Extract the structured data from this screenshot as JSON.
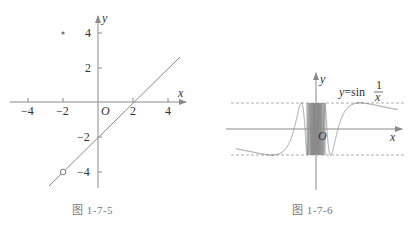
{
  "figure_1": {
    "caption": "图 1-7-5",
    "axis_x_label": "x",
    "axis_y_label": "y",
    "origin_label": "O",
    "x_ticks": [
      "−4",
      "−2",
      "2",
      "4"
    ],
    "y_ticks": [
      "4",
      "2",
      "−2",
      "−4"
    ],
    "line": "y = x − 2 (x ≠ −2)",
    "filled_point": "(−2, 4)",
    "open_point": "(−2, −4)"
  },
  "figure_2": {
    "caption": "图 1-7-6",
    "axis_x_label": "x",
    "axis_y_label": "y",
    "origin_label": "O",
    "function_label_prefix": "y=sin",
    "function_label_num": "1",
    "function_label_den": "x",
    "bounds": [
      "y = 1",
      "y = −1"
    ]
  },
  "colors": {
    "line": "#8a8a8a",
    "axis": "#8a8a8a",
    "text": "#333333",
    "caption": "#777777"
  }
}
